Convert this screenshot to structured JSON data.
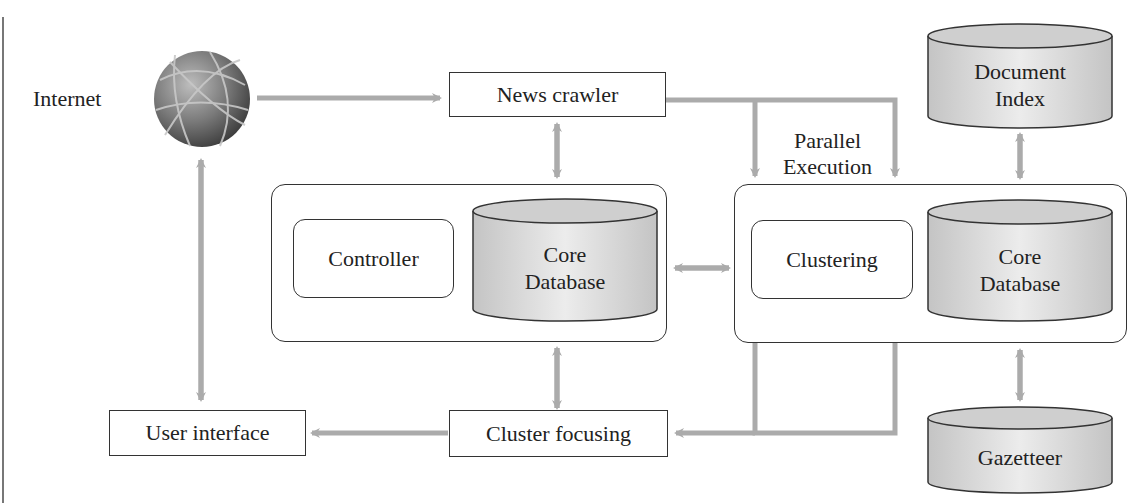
{
  "diagram": {
    "internet": {
      "label": "Internet",
      "icon": "globe-icon"
    },
    "news_crawler": {
      "label": "News crawler"
    },
    "parallel": {
      "line1": "Parallel",
      "line2": "Execution"
    },
    "document_index": {
      "line1": "Document",
      "line2": "Index"
    },
    "left_node": {
      "controller": "Controller",
      "db_line1": "Core",
      "db_line2": "Database"
    },
    "right_node": {
      "clustering": "Clustering",
      "db_line1": "Core",
      "db_line2": "Database"
    },
    "user_interface": {
      "label": "User interface"
    },
    "cluster_focusing": {
      "label": "Cluster focusing"
    },
    "gazetteer": {
      "label": "Gazetteer"
    }
  },
  "colors": {
    "arrow": "#ababab",
    "border": "#333333",
    "cylinder_fill": "#d6d6d6",
    "cylinder_top": "#cfcfcf"
  }
}
